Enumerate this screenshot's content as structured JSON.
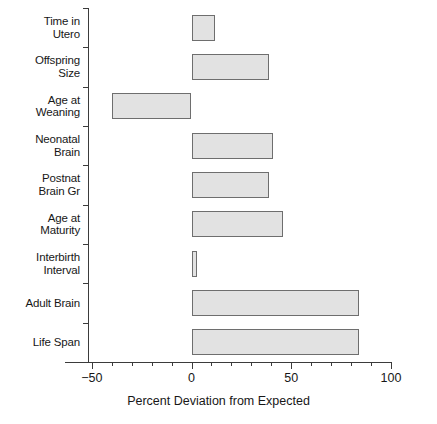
{
  "chart_data": {
    "type": "bar",
    "orientation": "horizontal",
    "title": "",
    "xlabel": "Percent Deviation from Expected",
    "ylabel": "",
    "xlim": [
      -50,
      100
    ],
    "ylim": null,
    "grid": false,
    "legend": null,
    "x_ticks_major": [
      -50,
      0,
      50,
      100
    ],
    "x_tick_labels": [
      "−50",
      "0",
      "50",
      "100"
    ],
    "x_ticks_minor_step": 10,
    "bar_fill_color": "#e2e2e2",
    "bar_edge_color": "#6e6e6e",
    "axis_color": "#3b3b3b",
    "categories": [
      "Time in\nUtero",
      "Offspring\nSize",
      "Age at\nWeaning",
      "Neonatal\nBrain",
      "Postnat\nBrain Gr",
      "Age at\nMaturity",
      "Interbirth\nInterval",
      "Adult Brain",
      "Life Span"
    ],
    "values": [
      12,
      39,
      -40,
      41,
      39,
      46,
      3,
      84,
      84
    ]
  }
}
